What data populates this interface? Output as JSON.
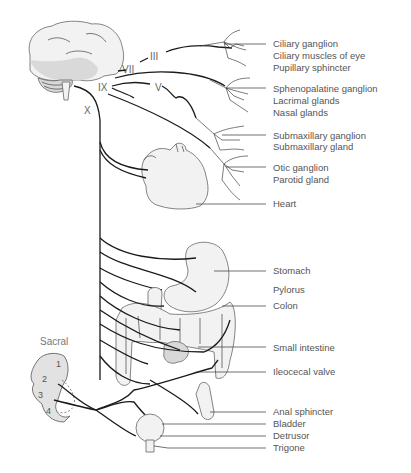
{
  "diagram": {
    "cranial_nerves": [
      "III",
      "VII",
      "IX",
      "V",
      "X"
    ],
    "sacral_label": "Sacral",
    "sacral_segments": [
      "1",
      "2",
      "3",
      "4"
    ],
    "labels": [
      {
        "id": "ciliary-ganglion",
        "text": "Ciliary ganglion"
      },
      {
        "id": "ciliary-muscles",
        "text": "Ciliary muscles of eye"
      },
      {
        "id": "pupillary-sphincter",
        "text": "Pupillary sphincter"
      },
      {
        "id": "sphenopalatine-ganglion",
        "text": "Sphenopalatine ganglion"
      },
      {
        "id": "lacrimal-glands",
        "text": "Lacrimal glands"
      },
      {
        "id": "nasal-glands",
        "text": "Nasal glands"
      },
      {
        "id": "submaxillary-ganglion",
        "text": "Submaxillary ganglion"
      },
      {
        "id": "submaxillary-gland",
        "text": "Submaxillary gland"
      },
      {
        "id": "otic-ganglion",
        "text": "Otic ganglion"
      },
      {
        "id": "parotid-gland",
        "text": "Parotid gland"
      },
      {
        "id": "heart",
        "text": "Heart"
      },
      {
        "id": "stomach",
        "text": "Stomach"
      },
      {
        "id": "pylorus",
        "text": "Pylorus"
      },
      {
        "id": "colon",
        "text": "Colon"
      },
      {
        "id": "small-intestine",
        "text": "Small intestine"
      },
      {
        "id": "ileocecal-valve",
        "text": "Ileocecal valve"
      },
      {
        "id": "anal-sphincter",
        "text": "Anal sphincter"
      },
      {
        "id": "bladder",
        "text": "Bladder"
      },
      {
        "id": "detrusor",
        "text": "Detrusor"
      },
      {
        "id": "trigone",
        "text": "Trigone"
      }
    ]
  }
}
